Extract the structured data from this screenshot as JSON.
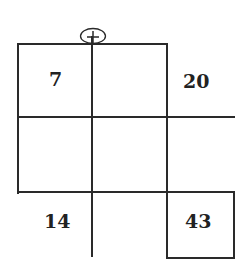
{
  "diagram": {
    "marker": {
      "symbol": "plus-in-circle"
    },
    "cells": {
      "top_left": "7",
      "top_right_outside": "20",
      "bottom_left_outside": "14",
      "bottom_right_box": "43"
    },
    "colors": {
      "line": "#2a2a2a",
      "background": "#ffffff"
    }
  }
}
